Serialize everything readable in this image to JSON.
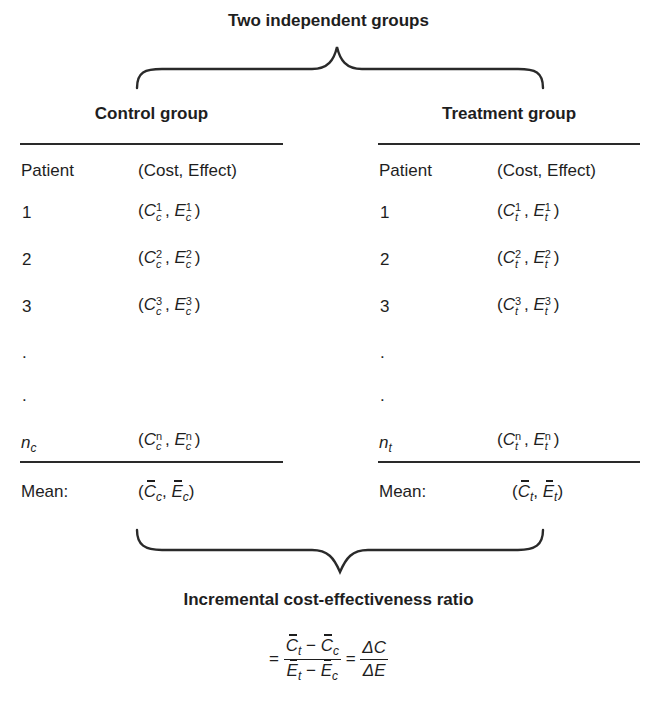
{
  "diagram": {
    "top_title": "Two independent groups",
    "bottom_title": "Incremental cost-effectiveness ratio",
    "control": {
      "title": "Control group",
      "col_patient": "Patient",
      "col_pair": "(Cost, Effect)",
      "rows": [
        {
          "patient": "1",
          "sup": "1",
          "sub": "c"
        },
        {
          "patient": "2",
          "sup": "2",
          "sub": "c"
        },
        {
          "patient": "3",
          "sup": "3",
          "sub": "c"
        },
        {
          "patient": ".",
          "sup": "",
          "sub": ""
        },
        {
          "patient": ".",
          "sup": "",
          "sub": ""
        }
      ],
      "last_row": {
        "patient_main": "n",
        "patient_sub": "c",
        "sup": "n",
        "sub": "c"
      },
      "mean_label": "Mean:",
      "mean_sub": "c"
    },
    "treatment": {
      "title": "Treatment group",
      "col_patient": "Patient",
      "col_pair": "(Cost, Effect)",
      "rows": [
        {
          "patient": "1",
          "sup": "1",
          "sub": "t"
        },
        {
          "patient": "2",
          "sup": "2",
          "sub": "t"
        },
        {
          "patient": "3",
          "sup": "3",
          "sub": "t"
        },
        {
          "patient": ".",
          "sup": "",
          "sub": ""
        },
        {
          "patient": ".",
          "sup": "",
          "sub": ""
        }
      ],
      "last_row": {
        "patient_main": "n",
        "patient_sub": "t",
        "sup": "n",
        "sub": "t"
      },
      "mean_label": "Mean:",
      "mean_sub": "t"
    },
    "formula": {
      "equals": "=",
      "num_left": "C",
      "num_left_sub": "t",
      "minus": "−",
      "num_right": "C",
      "num_right_sub": "c",
      "den_left": "E",
      "den_left_sub": "t",
      "den_right": "E",
      "den_right_sub": "c",
      "delta_num": "ΔC",
      "delta_den": "ΔE"
    },
    "symbols": {
      "open": "(",
      "close": ")",
      "comma": ", ",
      "C": "C",
      "E": "E"
    }
  }
}
